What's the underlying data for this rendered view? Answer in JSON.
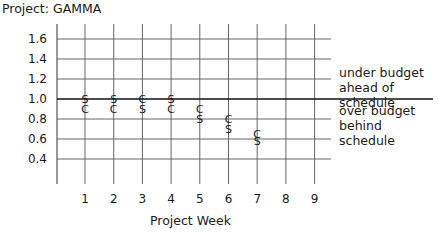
{
  "title": "Project: GAMMA",
  "annotations": {
    "upper_line1": "under budget",
    "upper_line2": "ahead of schedule",
    "lower_line1": "over budget",
    "lower_line2": "behind schedule"
  },
  "chart_data": {
    "type": "scatter",
    "title": "Project: GAMMA",
    "xlabel": "Project Week",
    "ylabel": "",
    "x": [
      1,
      2,
      3,
      4,
      5,
      6,
      7
    ],
    "x_ticks": [
      1,
      2,
      3,
      4,
      5,
      6,
      7,
      8,
      9
    ],
    "y_ticks": [
      0.4,
      0.6,
      0.8,
      1.0,
      1.2,
      1.4,
      1.6
    ],
    "y_tick_labels": [
      "0.4",
      "0.6",
      "0.8",
      "1.0",
      "1.2",
      "1.4",
      "1.6"
    ],
    "ylim": [
      0.2,
      1.7
    ],
    "xlim": [
      0,
      9.5
    ],
    "grid": true,
    "reference_line": 1.0,
    "series": [
      {
        "name": "S",
        "marker": "S",
        "values": [
          1.0,
          1.0,
          0.9,
          1.0,
          0.8,
          0.7,
          0.58
        ]
      },
      {
        "name": "C",
        "marker": "C",
        "values": [
          0.9,
          0.9,
          1.0,
          0.9,
          0.9,
          0.8,
          0.65
        ]
      }
    ]
  }
}
